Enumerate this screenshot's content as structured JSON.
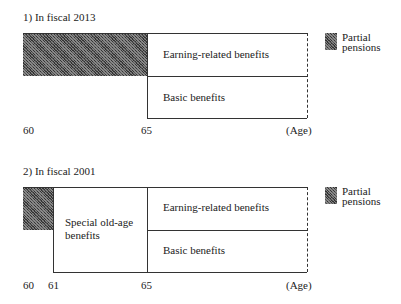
{
  "panels": [
    {
      "title": "1) In fiscal 2013",
      "segments": {
        "upper": "Earning-related benefits",
        "lower": "Basic benefits"
      },
      "ticks": [
        "60",
        "65"
      ],
      "axis_unit": "(Age)",
      "legend": {
        "line1": "Partial",
        "line2": "pensions"
      }
    },
    {
      "title": "2) In fiscal 2001",
      "segments": {
        "special_line1": "Special old-age",
        "special_line2": "benefits",
        "upper": "Earning-related benefits",
        "lower": "Basic benefits"
      },
      "ticks": [
        "60",
        "61",
        "65"
      ],
      "axis_unit": "(Age)",
      "legend": {
        "line1": "Partial",
        "line2": "pensions"
      }
    }
  ]
}
